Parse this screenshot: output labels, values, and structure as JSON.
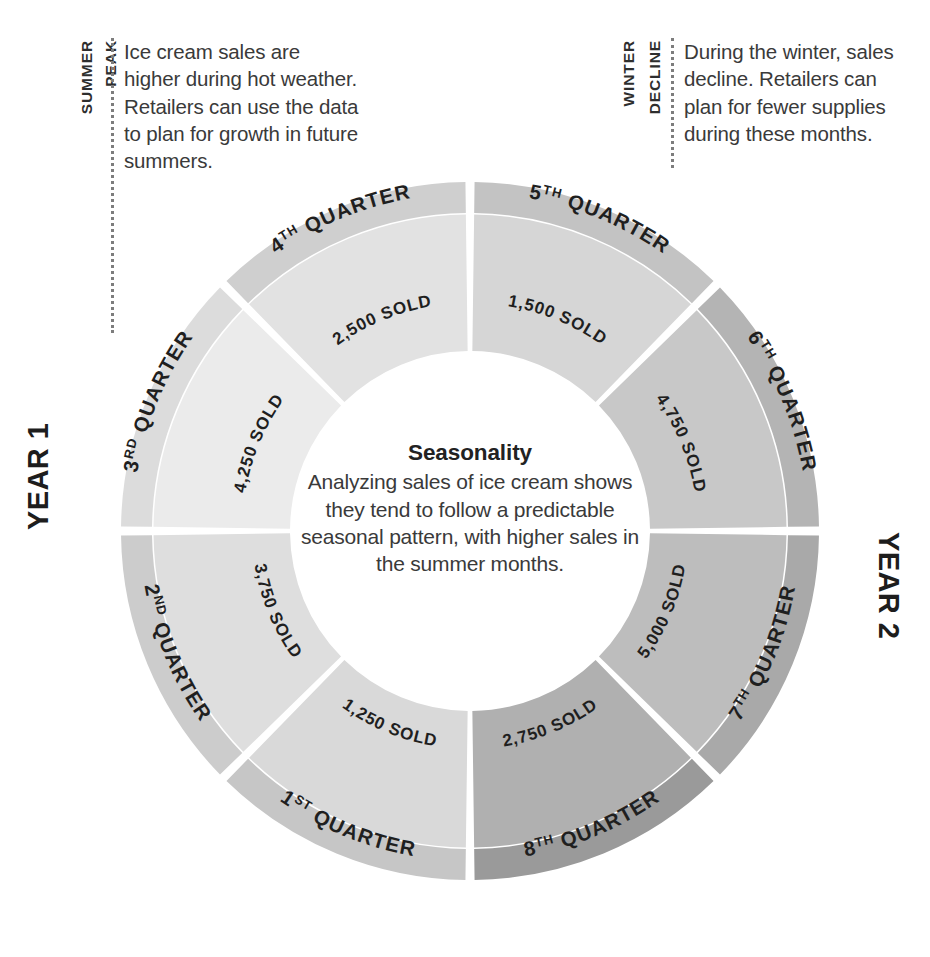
{
  "chart_data": {
    "type": "pie",
    "title": "Seasonality",
    "subtitle": "Analyzing sales of ice cream shows they tend to follow a predictable seasonal pattern, with higher sales in the summer months.",
    "unit_label": "SOLD",
    "legend_position": "none",
    "grid": false,
    "categories": [
      "1ST QUARTER",
      "2ND QUARTER",
      "3RD QUARTER",
      "4TH QUARTER",
      "5TH QUARTER",
      "6TH QUARTER",
      "7TH QUARTER",
      "8TH QUARTER"
    ],
    "values": [
      1250,
      3750,
      4250,
      2500,
      1500,
      4750,
      5000,
      2750
    ],
    "value_labels": [
      "1,250 SOLD",
      "3,750 SOLD",
      "4,250 SOLD",
      "2,500 SOLD",
      "1,500 SOLD",
      "4,750 SOLD",
      "5,000 SOLD",
      "2,750 SOLD"
    ],
    "groups": [
      {
        "name": "YEAR 1",
        "categories": [
          "1ST QUARTER",
          "2ND QUARTER",
          "3RD QUARTER",
          "4TH QUARTER"
        ]
      },
      {
        "name": "YEAR 2",
        "categories": [
          "5TH QUARTER",
          "6TH QUARTER",
          "7TH QUARTER",
          "8TH QUARTER"
        ]
      }
    ],
    "slice_colors_outer": [
      "#c6c6c6",
      "#cccccc",
      "#dcdcdc",
      "#cfcfcf",
      "#c3c3c3",
      "#b4b4b4",
      "#a9a9a9",
      "#9a9a9a"
    ],
    "slice_colors_inner": [
      "#d9d9d9",
      "#dedede",
      "#ebebeb",
      "#e2e2e2",
      "#d6d6d6",
      "#c8c8c8",
      "#bdbdbd",
      "#b0b0b0"
    ]
  },
  "center": {
    "title": "Seasonality",
    "body": "Analyzing sales of ice cream shows they tend to follow a predictable seasonal pattern, with higher sales in the summer months."
  },
  "year_labels": {
    "left": "YEAR 1",
    "right": "YEAR 2"
  },
  "segments": [
    {
      "id": "q1",
      "quarter_number": "1",
      "ordinal_suffix": "ST",
      "quarter_label": "1ST QUARTER",
      "sold_label": "1,250 SOLD",
      "value": 1250
    },
    {
      "id": "q2",
      "quarter_number": "2",
      "ordinal_suffix": "ND",
      "quarter_label": "2ND QUARTER",
      "sold_label": "3,750 SOLD",
      "value": 3750
    },
    {
      "id": "q3",
      "quarter_number": "3",
      "ordinal_suffix": "RD",
      "quarter_label": "3RD QUARTER",
      "sold_label": "4,250 SOLD",
      "value": 4250
    },
    {
      "id": "q4",
      "quarter_number": "4",
      "ordinal_suffix": "TH",
      "quarter_label": "4TH QUARTER",
      "sold_label": "2,500 SOLD",
      "value": 2500
    },
    {
      "id": "q5",
      "quarter_number": "5",
      "ordinal_suffix": "TH",
      "quarter_label": "5TH QUARTER",
      "sold_label": "1,500 SOLD",
      "value": 1500
    },
    {
      "id": "q6",
      "quarter_number": "6",
      "ordinal_suffix": "TH",
      "quarter_label": "6TH QUARTER",
      "sold_label": "4,750 SOLD",
      "value": 4750
    },
    {
      "id": "q7",
      "quarter_number": "7",
      "ordinal_suffix": "TH",
      "quarter_label": "7TH QUARTER",
      "sold_label": "5,000 SOLD",
      "value": 5000
    },
    {
      "id": "q8",
      "quarter_number": "8",
      "ordinal_suffix": "TH",
      "quarter_label": "8TH QUARTER",
      "sold_label": "2,750 SOLD",
      "value": 2750
    }
  ],
  "annotations": {
    "summer": {
      "kicker_line1": "SUMMER",
      "kicker_line2": "PEAK",
      "body": "Ice cream sales are higher during hot weather. Retailers can use the data to plan for growth in future summers."
    },
    "winter": {
      "kicker_line1": "WINTER",
      "kicker_line2": "DECLINE",
      "body": "During the winter, sales decline. Retailers can plan for fewer supplies during these months."
    }
  },
  "colors": {
    "background": "#ffffff",
    "text": "#3a3a3a",
    "heading": "#1d1d1d",
    "leader_line": "#7d7d7d"
  }
}
